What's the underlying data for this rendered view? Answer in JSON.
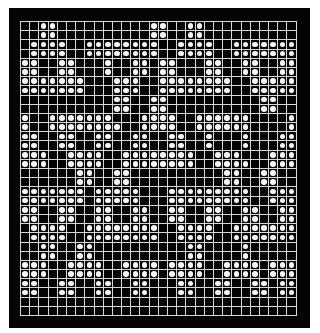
{
  "board": {
    "cols": 30,
    "rows": 32,
    "colors": {
      "background": "#050505",
      "grid_line": "#d8d8d8",
      "dot": "#f4f4f4",
      "page": "#ffffff"
    },
    "cells": [
      "001100000000001100110000000000",
      "001100000000001100110000000000",
      "011110011111111001111001111111",
      "011110011111111001111001111111",
      "110011000100110110001100110011",
      "110011000100110110001100110011",
      "111111100011100111111110011111",
      "111111100011100111111110011111",
      "000000000011001100000000001100",
      "000000000011001100000000001100",
      "100111111100011110011111100001",
      "100111111110011110011111100001",
      "110011001100110011001000100011",
      "110011001100110011001000100011",
      "111001111001111111100111000111",
      "111001111001111111100111100111",
      "000000110011000000000011001100",
      "000000110011000000000011001100",
      "111111101111100011111111100111",
      "111111101111100011111111100111",
      "110011001100110011001100110011",
      "110011001100110011001100110011",
      "011110011111111001111001111111",
      "011110011111111001111001111111",
      "001100110000000000110000100000",
      "001100110000000000110000100000",
      "111001111001111011110011110111",
      "111001111001111011110011110111",
      "110011001100110001100110011011",
      "110011001100110001100110011011",
      "000000000000000000000000000000",
      "000000000000000000000000000000"
    ]
  }
}
